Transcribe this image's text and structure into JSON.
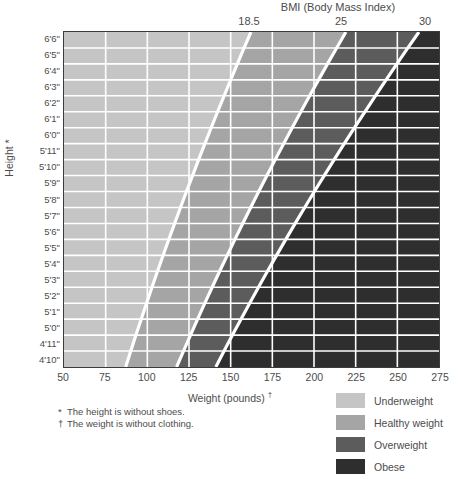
{
  "chart_data": {
    "type": "heatmap",
    "title": "BMI (Body Mass Index)",
    "xlabel": "Weight (pounds) †",
    "ylabel": "Height *",
    "xlim": [
      50,
      275
    ],
    "x_ticks": [
      50,
      75,
      100,
      125,
      150,
      175,
      200,
      225,
      250,
      275
    ],
    "x_tick_labels": [
      "50",
      "75",
      "100",
      "125",
      "150",
      "175",
      "200",
      "225",
      "250",
      "275"
    ],
    "y_categories": [
      "6'6\"",
      "6'5\"",
      "6'4\"",
      "6'3\"",
      "6'2\"",
      "6'1\"",
      "6'0\"",
      "5'11\"",
      "5'10\"",
      "5'9\"",
      "5'8\"",
      "5'7\"",
      "5'6\"",
      "5'5\"",
      "5'4\"",
      "5'3\"",
      "5'2\"",
      "5'1\"",
      "5'0\"",
      "4'11\"",
      "4'10\""
    ],
    "y_inches": [
      78,
      77,
      76,
      75,
      74,
      73,
      72,
      71,
      70,
      69,
      68,
      67,
      66,
      65,
      64,
      63,
      62,
      61,
      60,
      59,
      58
    ],
    "bmi_boundaries": [
      18.5,
      25,
      30
    ],
    "bmi_boundary_labels": [
      "18.5",
      "25",
      "30"
    ],
    "bmi_boundary_weights_top_row": [
      158.1,
      213.6,
      256.4
    ],
    "bmi_boundary_weights_bottom_row": [
      88.4,
      119.5,
      143.4
    ],
    "grid": true,
    "legend_position": "bottom-right",
    "categories_legend": [
      "Underweight",
      "Healthy weight",
      "Overweight",
      "Obese"
    ],
    "band_ranges": [
      {
        "name": "Underweight",
        "bmi_min": 0,
        "bmi_max": 18.5
      },
      {
        "name": "Healthy weight",
        "bmi_min": 18.5,
        "bmi_max": 25
      },
      {
        "name": "Overweight",
        "bmi_min": 25,
        "bmi_max": 30
      },
      {
        "name": "Obese",
        "bmi_min": 30,
        "bmi_max": 99
      }
    ]
  },
  "top": {
    "bmi_title": "BMI (Body Mass Index)",
    "ticks": [
      {
        "label": "18.5",
        "left": 249
      },
      {
        "label": "25",
        "left": 341
      },
      {
        "label": "30",
        "left": 425
      }
    ]
  },
  "axes": {
    "y_title": "Height *",
    "y_labels": [
      "6'6\"",
      "6'5\"",
      "6'4\"",
      "6'3\"",
      "6'2\"",
      "6'1\"",
      "6'0\"",
      "5'11\"",
      "5'10\"",
      "5'9\"",
      "5'8\"",
      "5'7\"",
      "5'6\"",
      "5'5\"",
      "5'4\"",
      "5'3\"",
      "5'2\"",
      "5'1\"",
      "5'0\"",
      "4'11\"",
      "4'10\""
    ],
    "x_title": "Weight (pounds) ",
    "x_title_dagger": "†",
    "x_labels": [
      "50",
      "75",
      "100",
      "125",
      "150",
      "175",
      "200",
      "225",
      "250",
      "275"
    ]
  },
  "footnotes": [
    {
      "mark": "*",
      "text": "The height is without shoes."
    },
    {
      "mark": "†",
      "text": "The weight is without clothing."
    }
  ],
  "legend": {
    "items": [
      {
        "label": "Underweight",
        "color": "#c5c5c5"
      },
      {
        "label": "Healthy weight",
        "color": "#a5a5a5"
      },
      {
        "label": "Overweight",
        "color": "#5c5c5c"
      },
      {
        "label": "Obese",
        "color": "#2e2e2e"
      }
    ]
  },
  "colors": {
    "underweight": "#c5c5c5",
    "healthy": "#a5a5a5",
    "overweight": "#5c5c5c",
    "obese": "#2e2e2e",
    "grid": "#ffffff",
    "boundary_line": "#ffffff",
    "frame": "#3b3b3b",
    "text": "#4c4c4c"
  }
}
